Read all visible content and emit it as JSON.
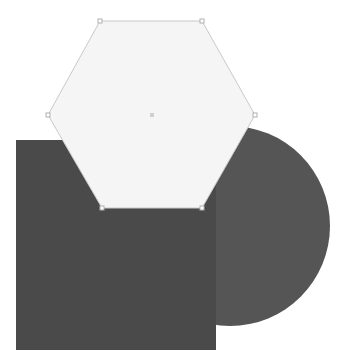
{
  "canvas": {
    "width": 358,
    "height": 364,
    "background_color": "#ffffff",
    "name": "shape-composition-canvas"
  },
  "shapes": [
    {
      "id": "circle",
      "label": "Circle",
      "type": "circle",
      "fill_color": "#555555",
      "stroke_color": "none",
      "stroke_width": 0,
      "center_x": 230,
      "center_y": 226,
      "radius": 100,
      "z_order": 1,
      "selected": false
    },
    {
      "id": "square",
      "label": "Square",
      "type": "rect",
      "fill_color": "#4a4a4a",
      "stroke_color": "none",
      "stroke_width": 0,
      "x": 16,
      "y": 140,
      "width": 200,
      "height": 210,
      "z_order": 2,
      "selected": false
    },
    {
      "id": "hexagon",
      "label": "Hexagon",
      "type": "polygon",
      "fill_color": "#f5f5f5",
      "stroke_color": "#c9c9c9",
      "stroke_width": 1,
      "points": "100,21 202,21 255,115 202,208 102,208 48,115",
      "vertices": [
        {
          "x": 100,
          "y": 21
        },
        {
          "x": 202,
          "y": 21
        },
        {
          "x": 255,
          "y": 115
        },
        {
          "x": 202,
          "y": 208
        },
        {
          "x": 102,
          "y": 208
        },
        {
          "x": 48,
          "y": 115
        }
      ],
      "center_handle": {
        "x": 152,
        "y": 115
      },
      "z_order": 3,
      "selected": true
    }
  ],
  "handles": {
    "fill_color": "#ffffff",
    "stroke_color": "#b0b0b0",
    "size": 4,
    "center_marker_color": "#d0d0d0",
    "center_marker_size": 4
  }
}
